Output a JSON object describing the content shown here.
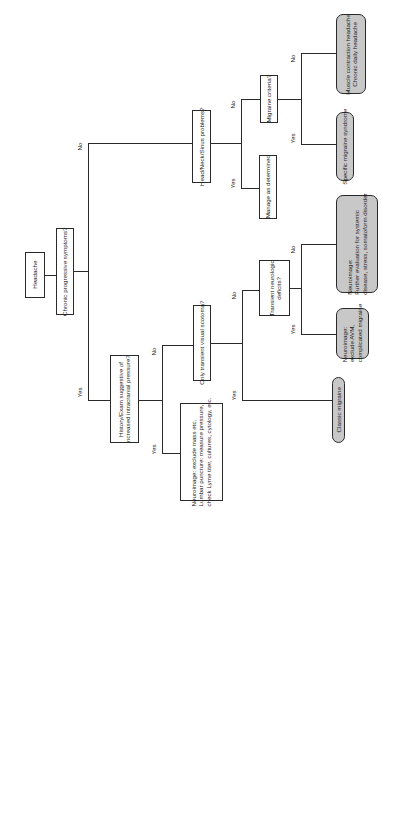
{
  "diagram": {
    "type": "flowchart",
    "orientation": "rotated -90deg",
    "nodes": {
      "headache": "Headache",
      "chronic": "Chronic progressive symptoms?",
      "history_l1": "History/Exam suggestive of",
      "history_l2": "increased intracranial pressure?",
      "neuro_mass_l1": "Neuroimage: exclude mass etc.",
      "neuro_mass_l2": "Lumbar puncture: measure pressure,",
      "neuro_mass_l3": "check Lyme titer, cultures, cytology, etc.",
      "scotoma": "Only transient visual scotoma?",
      "classic": "Classic migraine",
      "transient_l1": "Transient neurologic",
      "transient_l2": "deficits?",
      "avm_l1": "Neuroimage:",
      "avm_l2": "exclude AVM,",
      "avm_l3": "complicated migraine",
      "further_l1": "Neuroimage:",
      "further_l2": "Further evaluation for systemic",
      "further_l3": "disease, stress, somatoform disorder",
      "headneck": "Head/Neck/Sinus problems?",
      "manage": "Manage as determined",
      "criteria": "Migraine criteria?",
      "specific": "Specific migraine syndrome",
      "muscle_l1": "Muscle contraction headache",
      "muscle_l2": "Chronic daily headache"
    },
    "labels": {
      "yes": "Yes",
      "no": "No"
    },
    "colors": {
      "line": "#2a2a2a",
      "outcome_fill": "#c8c8c8",
      "box_fill": "#ffffff"
    }
  }
}
